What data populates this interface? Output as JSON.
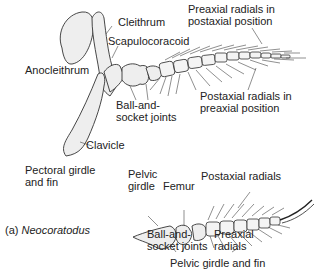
{
  "figure": {
    "panel_label": "(a)",
    "taxon": "Neocoratodus",
    "pectoral": {
      "caption_line1": "Pectoral girdle",
      "caption_line2": "and fin",
      "labels": {
        "cleithrum": "Cleithrum",
        "scapulocoracoid": "Scapulocoracoid",
        "anocleithrum": "Anocleithrum",
        "ball_socket_1": "Ball-and-",
        "ball_socket_2": "socket joints",
        "clavicle": "Clavicle",
        "preaxial_1": "Preaxial radials in",
        "preaxial_2": "postaxial position",
        "postaxial_1": "Postaxial radials in",
        "postaxial_2": "preaxial position"
      }
    },
    "pelvic": {
      "caption": "Pelvic girdle and fin",
      "labels": {
        "pelvic_girdle_1": "Pelvic",
        "pelvic_girdle_2": "girdle",
        "femur": "Femur",
        "postaxial": "Postaxial radials",
        "ball_socket_1": "Ball-and-",
        "ball_socket_2": "socket joints",
        "preaxial_1": "Preaxial",
        "preaxial_2": "radials"
      }
    }
  }
}
